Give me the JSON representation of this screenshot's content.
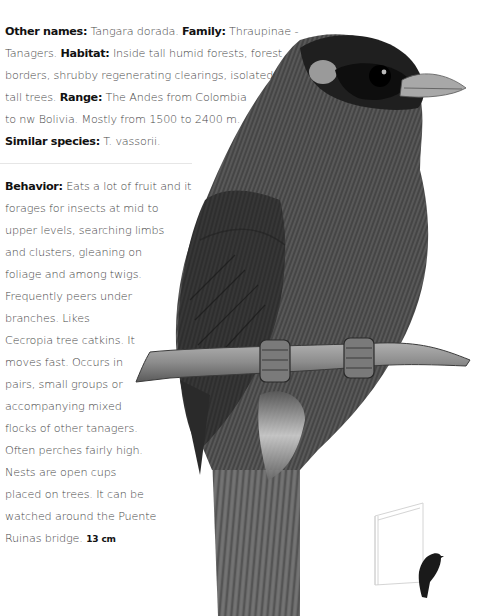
{
  "species_info": {
    "other_names": {
      "label": "Other names:",
      "value": "Tangara dorada."
    },
    "family": {
      "label": "Family:",
      "value": "Thraupinae - Tanagers."
    },
    "habitat": {
      "label": "Habitat:",
      "value": "Inside tall humid forests, forest borders, shrubby regenerating clearings, isolated tall trees."
    },
    "range": {
      "label": "Range:",
      "value": "The Andes from Colombia to nw Bolivia. Mostly from 1500 to 2400 m."
    },
    "similar_species": {
      "label": "Similar species:",
      "value": "T. vassorii."
    },
    "lines": [
      {
        "parts": [
          {
            "b": "Other names:"
          },
          {
            "t": " Tangara dorada. "
          },
          {
            "b": "Family:"
          },
          {
            "t": " Thraupinae -"
          }
        ]
      },
      {
        "parts": [
          {
            "t": "Tanagers. "
          },
          {
            "b": "Habitat:"
          },
          {
            "t": " Inside tall humid forests, forest"
          }
        ]
      },
      {
        "parts": [
          {
            "t": "borders, shrubby regenerating clearings, isolated"
          }
        ]
      },
      {
        "parts": [
          {
            "t": "tall trees. "
          },
          {
            "b": "Range:"
          },
          {
            "t": " The Andes from Colombia"
          }
        ]
      },
      {
        "parts": [
          {
            "t": "to nw Bolivia. Mostly from 1500 to 2400 m."
          }
        ]
      },
      {
        "parts": [
          {
            "b": "Similar species:"
          },
          {
            "t": " T. vassorii."
          }
        ]
      }
    ]
  },
  "behavior": {
    "label": "Behavior:",
    "size": "13 cm",
    "lines": [
      "Eats a lot of fruit and it",
      "forages for insects at mid to",
      "upper levels, searching limbs",
      "and clusters, gleaning on",
      "foliage and among twigs.",
      "Frequently peers under",
      "branches. Likes",
      "Cecropia tree catkins. It",
      "moves fast. Occurs in",
      "pairs, small groups or",
      "accompanying mixed",
      "flocks of other tanagers.",
      "Often perches fairly high.",
      "Nests are open cups",
      "placed on trees. It can be",
      "watched around the Puente",
      "Ruinas bridge."
    ]
  },
  "illustration": {
    "subject": "tanager-perched-on-branch",
    "size_comparison_icon": "book-with-bird-silhouette",
    "colors": {
      "body": "#4a4a4a",
      "dark": "#1c1c1c",
      "branch": "#8a8a8a",
      "cheek": "#9a9a9a"
    }
  }
}
